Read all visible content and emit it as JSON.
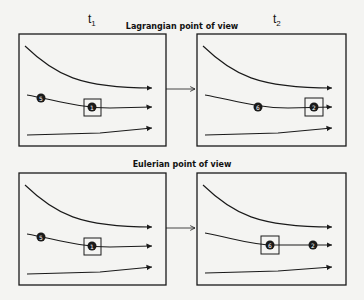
{
  "header": {
    "time_left": "t",
    "time_left_sub": "1",
    "time_right": "t",
    "time_right_sub": "2"
  },
  "sections": [
    {
      "title": "Lagrangian point of view",
      "panels": [
        {
          "time": "t1",
          "particles": [
            {
              "label": "5",
              "x": 40,
              "y": 98
            },
            {
              "label": "1",
              "x": 91,
              "y": 107,
              "boxed": true
            }
          ]
        },
        {
          "time": "t2",
          "particles": [
            {
              "label": "6",
              "x": 258,
              "y": 107
            },
            {
              "label": "2",
              "x": 315,
              "y": 107,
              "boxed": true
            }
          ]
        }
      ]
    },
    {
      "title": "Eulerian point of view",
      "panels": [
        {
          "time": "t1",
          "particles": [
            {
              "label": "5",
              "x": 40,
              "y": 237
            },
            {
              "label": "1",
              "x": 91,
              "y": 246,
              "boxed": true
            }
          ]
        },
        {
          "time": "t2",
          "particles": [
            {
              "label": "6",
              "x": 269,
              "y": 245,
              "boxed": true
            },
            {
              "label": "2",
              "x": 313,
              "y": 245
            }
          ]
        }
      ]
    }
  ],
  "colors": {
    "stroke": "#1a1a1a",
    "background": "#f4f4f2"
  }
}
